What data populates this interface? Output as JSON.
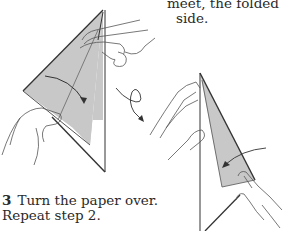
{
  "intro_text": {
    "line1": "meet, the folded",
    "line2": "side."
  },
  "step": {
    "number": "3",
    "line1": "Turn the paper over.",
    "line2": "Repeat step 2."
  },
  "illustrations": [
    {
      "name": "fold-step-left",
      "description": "hands folding paper edge toward center crease"
    },
    {
      "name": "turn-over-arrow",
      "description": "looped arrow indicating turn paper over"
    },
    {
      "name": "fold-step-right",
      "description": "hands folding paper on reverse side"
    }
  ],
  "colors": {
    "paper_fill": "#c8c8c8",
    "line": "#333333",
    "background": "#ffffff"
  }
}
